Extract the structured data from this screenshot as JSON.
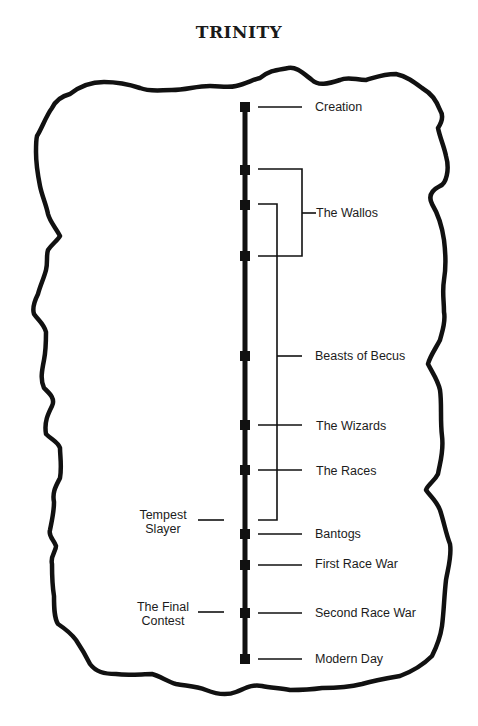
{
  "title": "TRINITY",
  "colors": {
    "ink": "#111111",
    "background": "#ffffff"
  },
  "timeline": {
    "right_events": [
      {
        "label": "Creation",
        "y": 107
      },
      {
        "label": "The Wallos",
        "y": 213
      },
      {
        "label": "Beasts of Becus",
        "y": 356
      },
      {
        "label": "The Wizards",
        "y": 425
      },
      {
        "label": "The Races",
        "y": 470
      },
      {
        "label": "Bantogs",
        "y": 534
      },
      {
        "label": "First Race War",
        "y": 565
      },
      {
        "label": "Second Race War",
        "y": 613
      },
      {
        "label": "Modern Day",
        "y": 659
      }
    ],
    "left_events": [
      {
        "label_line1": "Tempest",
        "label_line2": "Slayer",
        "y": 520
      },
      {
        "label_line1": "The Final",
        "label_line2": "Contest",
        "y": 612
      }
    ],
    "brackets": [
      {
        "name": "The Wallos",
        "from_y": 169,
        "to_y": 256
      },
      {
        "name": "Era span",
        "from_y": 204,
        "to_y": 520
      }
    ]
  }
}
